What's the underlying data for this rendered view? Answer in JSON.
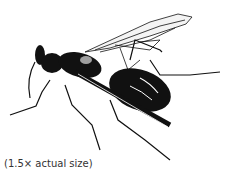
{
  "figure": {
    "caption": "(1.5× actual size)"
  }
}
